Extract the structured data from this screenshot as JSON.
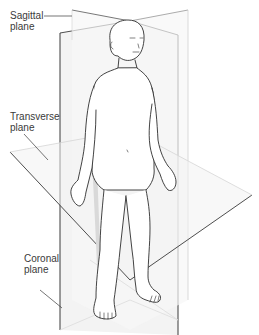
{
  "figure": {
    "labels": {
      "sagittal": {
        "line1": "Sagittal",
        "line2": "plane"
      },
      "transverse": {
        "line1": "Transverse",
        "line2": "plane"
      },
      "coronal": {
        "line1": "Coronal",
        "line2": "plane"
      }
    },
    "colors": {
      "background": "#ffffff",
      "plane_fill": "#f1f1f1",
      "plane_edge_dark": "#3a3a3a",
      "plane_edge_light": "#cfcfcf",
      "body_outline": "#2e2e2e",
      "body_shadow": "#d4d4d4",
      "text": "#3a3a3a"
    }
  }
}
